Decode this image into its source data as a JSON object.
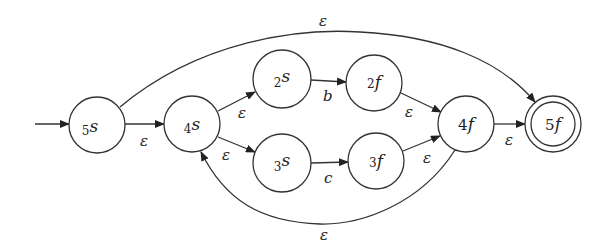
{
  "diagram": {
    "type": "NFA (Thompson construction)",
    "start_state": "5s",
    "accept_state": "5f",
    "nodes": [
      {
        "id": "5s",
        "prefix": "5",
        "letter": "s",
        "x": 97,
        "y": 125,
        "accepting": false
      },
      {
        "id": "4s",
        "prefix": "4",
        "letter": "s",
        "x": 192,
        "y": 124,
        "accepting": false
      },
      {
        "id": "2s",
        "prefix": "2",
        "letter": "s",
        "x": 282,
        "y": 79,
        "accepting": false
      },
      {
        "id": "2f",
        "prefix": "2",
        "letter": "f",
        "x": 374,
        "y": 83,
        "accepting": false
      },
      {
        "id": "3s",
        "prefix": "3",
        "letter": "s",
        "x": 282,
        "y": 163,
        "accepting": false
      },
      {
        "id": "3f",
        "prefix": "3",
        "letter": "f",
        "x": 376,
        "y": 161,
        "accepting": false
      },
      {
        "id": "4f",
        "prefix": "4",
        "letter": "f",
        "x": 466,
        "y": 124,
        "accepting": false
      },
      {
        "id": "5f",
        "prefix": "5",
        "letter": "f",
        "x": 553,
        "y": 124,
        "accepting": true
      }
    ],
    "edges": [
      {
        "from": "start",
        "to": "5s",
        "label": ""
      },
      {
        "from": "5s",
        "to": "4s",
        "label": "ε"
      },
      {
        "from": "4s",
        "to": "2s",
        "label": "ε"
      },
      {
        "from": "4s",
        "to": "3s",
        "label": "ε"
      },
      {
        "from": "2s",
        "to": "2f",
        "label": "b"
      },
      {
        "from": "3s",
        "to": "3f",
        "label": "c"
      },
      {
        "from": "2f",
        "to": "4f",
        "label": "ε"
      },
      {
        "from": "3f",
        "to": "4f",
        "label": "ε"
      },
      {
        "from": "4f",
        "to": "5f",
        "label": "ε"
      },
      {
        "from": "5s",
        "to": "5f",
        "label": "ε"
      },
      {
        "from": "4f",
        "to": "4s",
        "label": "ε"
      }
    ]
  },
  "labels": {
    "n5s": {
      "p": "5",
      "l": "s"
    },
    "n4s": {
      "p": "4",
      "l": "s"
    },
    "n2s": {
      "p": "2",
      "l": "s"
    },
    "n2f": {
      "p": "2",
      "l": "f"
    },
    "n3s": {
      "p": "3",
      "l": "s"
    },
    "n3f": {
      "p": "3",
      "l": "f"
    },
    "n4f": {
      "p": "4",
      "l": "f"
    },
    "n5f": {
      "p": "5",
      "l": "f"
    },
    "e_5s_4s": "ε",
    "e_4s_2s": "ε",
    "e_4s_3s": "ε",
    "e_2s_2f": "b",
    "e_3s_3f": "c",
    "e_2f_4f": "ε",
    "e_3f_4f": "ε",
    "e_4f_5f": "ε",
    "e_5s_5f": "ε",
    "e_4f_4s": "ε"
  }
}
